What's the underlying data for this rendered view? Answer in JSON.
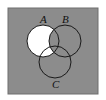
{
  "diagram": {
    "type": "venn",
    "background_color": "#8c8c8c",
    "shaded_color": "#ffffff",
    "outline_color": "#1a1a1a",
    "frame": {
      "x": 8,
      "y": 8,
      "width": 90,
      "height": 86
    },
    "sets": [
      {
        "label": "A",
        "cx": 43,
        "cy": 41,
        "r": 16,
        "label_x": 40,
        "label_y": 23
      },
      {
        "label": "B",
        "cx": 65,
        "cy": 41,
        "r": 16,
        "label_x": 62,
        "label_y": 23
      },
      {
        "label": "C",
        "cx": 55,
        "cy": 62,
        "r": 16,
        "label_x": 52,
        "label_y": 88
      }
    ],
    "shaded_region": "A minus B"
  }
}
